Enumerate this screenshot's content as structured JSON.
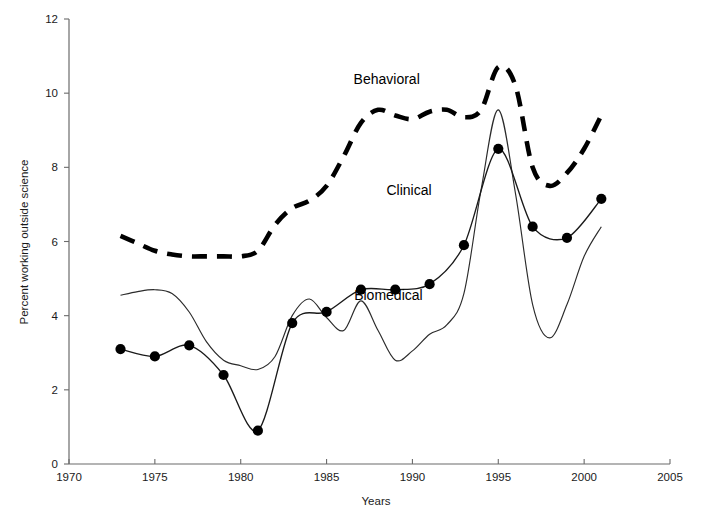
{
  "chart_data": {
    "type": "line",
    "title": "",
    "xlabel": "Years",
    "ylabel": "Percent working outside science",
    "xlim": [
      1970,
      2005
    ],
    "ylim": [
      0,
      12
    ],
    "xticks": [
      1970,
      1975,
      1980,
      1985,
      1990,
      1995,
      2000,
      2005
    ],
    "yticks": [
      0,
      2,
      4,
      6,
      8,
      10,
      12
    ],
    "grid": false,
    "legend_position": "inline-annotations",
    "series": [
      {
        "name": "Behavioral",
        "style": "dashed-thick",
        "markers": false,
        "x": [
          1973,
          1974,
          1975,
          1976,
          1977,
          1978,
          1979,
          1980,
          1981,
          1982,
          1983,
          1984,
          1985,
          1986,
          1987,
          1988,
          1989,
          1990,
          1991,
          1992,
          1993,
          1994,
          1995,
          1996,
          1997,
          1998,
          1999,
          2000,
          2001
        ],
        "values": [
          6.15,
          5.95,
          5.75,
          5.65,
          5.6,
          5.6,
          5.6,
          5.6,
          5.75,
          6.45,
          6.9,
          7.1,
          7.5,
          8.3,
          9.2,
          9.55,
          9.4,
          9.3,
          9.5,
          9.55,
          9.35,
          9.55,
          10.7,
          10.2,
          8.0,
          7.5,
          7.85,
          8.5,
          9.4
        ]
      },
      {
        "name": "Clinical",
        "style": "thin-solid",
        "markers": false,
        "x": [
          1973,
          1974,
          1975,
          1976,
          1977,
          1978,
          1979,
          1980,
          1981,
          1982,
          1983,
          1984,
          1985,
          1986,
          1987,
          1988,
          1989,
          1990,
          1991,
          1992,
          1993,
          1994,
          1995,
          1996,
          1997,
          1998,
          1999,
          2000,
          2001
        ],
        "values": [
          4.55,
          4.65,
          4.7,
          4.6,
          4.1,
          3.3,
          2.8,
          2.65,
          2.55,
          2.9,
          4.0,
          4.45,
          3.95,
          3.6,
          4.4,
          3.6,
          2.8,
          3.05,
          3.5,
          3.75,
          4.6,
          7.4,
          9.55,
          7.3,
          4.3,
          3.4,
          4.3,
          5.6,
          6.4
        ]
      },
      {
        "name": "Biomedical",
        "style": "solid-with-markers",
        "markers": true,
        "x": [
          1973,
          1975,
          1977,
          1979,
          1981,
          1983,
          1985,
          1987,
          1989,
          1991,
          1993,
          1995,
          1997,
          1999,
          2001
        ],
        "values": [
          3.1,
          2.9,
          3.2,
          2.4,
          0.9,
          3.8,
          4.1,
          4.7,
          4.7,
          4.85,
          5.9,
          8.5,
          6.4,
          6.1,
          7.15
        ]
      }
    ],
    "annotations": [
      {
        "text": "Behavioral",
        "x": 1988.5,
        "y": 10.25
      },
      {
        "text": "Clinical",
        "x": 1989.8,
        "y": 7.25
      },
      {
        "text": "Biomedical",
        "x": 1988.6,
        "y": 4.42
      }
    ]
  }
}
